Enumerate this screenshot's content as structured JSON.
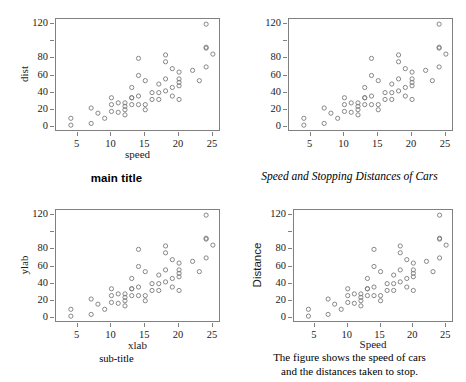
{
  "figure": {
    "point_color": "#7a7a7a",
    "axis_color": "#808080",
    "text_color": "#1a1a1a",
    "background": "#ffffff"
  },
  "chart_data": [
    {
      "id": "top-left",
      "type": "scatter",
      "title": "main title",
      "title_style": "sans-bold",
      "subtitle": "",
      "caption": "",
      "xlabel": "speed",
      "ylabel": "dist",
      "xlim": [
        1.8,
        26.2
      ],
      "ylim": [
        -6,
        126
      ],
      "xticks": [
        5,
        10,
        15,
        20,
        25
      ],
      "yticks": [
        0,
        20,
        40,
        60,
        80,
        100,
        120
      ],
      "ytick_labels": [
        "0",
        "20",
        "40",
        "60",
        "80",
        "",
        "120"
      ],
      "xtick_labels": [
        "5",
        "10",
        "15",
        "20",
        "25"
      ],
      "grid": false,
      "legend": "none",
      "x": [
        4,
        4,
        7,
        7,
        8,
        9,
        10,
        10,
        10,
        11,
        11,
        12,
        12,
        12,
        12,
        13,
        13,
        13,
        13,
        14,
        14,
        14,
        14,
        15,
        15,
        15,
        16,
        16,
        17,
        17,
        17,
        18,
        18,
        18,
        18,
        19,
        19,
        19,
        20,
        20,
        20,
        20,
        20,
        22,
        23,
        24,
        24,
        24,
        24,
        25
      ],
      "y": [
        2,
        10,
        4,
        22,
        16,
        10,
        18,
        26,
        34,
        17,
        28,
        14,
        20,
        24,
        28,
        26,
        34,
        34,
        46,
        26,
        36,
        60,
        80,
        20,
        26,
        54,
        32,
        40,
        32,
        40,
        50,
        42,
        56,
        76,
        84,
        36,
        46,
        68,
        32,
        48,
        52,
        56,
        64,
        66,
        54,
        70,
        92,
        93,
        120,
        85
      ]
    },
    {
      "id": "top-right",
      "type": "scatter",
      "title": "Speed and Stopping Distances of Cars",
      "title_style": "serif-italic",
      "subtitle": "",
      "caption": "",
      "xlabel": "",
      "ylabel": "",
      "xlim": [
        1.8,
        26.2
      ],
      "ylim": [
        -6,
        126
      ],
      "xticks": [
        5,
        10,
        15,
        20,
        25
      ],
      "yticks": [
        0,
        20,
        40,
        60,
        80,
        100,
        120
      ],
      "ytick_labels": [
        "0",
        "20",
        "40",
        "60",
        "80",
        "",
        "120"
      ],
      "xtick_labels": [
        "5",
        "10",
        "15",
        "20",
        "25"
      ],
      "grid": false,
      "legend": "none",
      "x": [
        4,
        4,
        7,
        7,
        8,
        9,
        10,
        10,
        10,
        11,
        11,
        12,
        12,
        12,
        12,
        13,
        13,
        13,
        13,
        14,
        14,
        14,
        14,
        15,
        15,
        15,
        16,
        16,
        17,
        17,
        17,
        18,
        18,
        18,
        18,
        19,
        19,
        19,
        20,
        20,
        20,
        20,
        20,
        22,
        23,
        24,
        24,
        24,
        24,
        25
      ],
      "y": [
        2,
        10,
        4,
        22,
        16,
        10,
        18,
        26,
        34,
        17,
        28,
        14,
        20,
        24,
        28,
        26,
        34,
        34,
        46,
        26,
        36,
        60,
        80,
        20,
        26,
        54,
        32,
        40,
        32,
        40,
        50,
        42,
        56,
        76,
        84,
        36,
        46,
        68,
        32,
        48,
        52,
        56,
        64,
        66,
        54,
        70,
        92,
        93,
        120,
        85
      ]
    },
    {
      "id": "bottom-left",
      "type": "scatter",
      "title": "",
      "title_style": "",
      "subtitle": "sub-title",
      "caption": "",
      "xlabel": "xlab",
      "ylabel": "ylab",
      "xlim": [
        1.8,
        26.2
      ],
      "ylim": [
        -6,
        126
      ],
      "xticks": [
        5,
        10,
        15,
        20,
        25
      ],
      "yticks": [
        0,
        20,
        40,
        60,
        80,
        100,
        120
      ],
      "ytick_labels": [
        "0",
        "20",
        "40",
        "60",
        "80",
        "",
        "120"
      ],
      "xtick_labels": [
        "5",
        "10",
        "15",
        "20",
        "25"
      ],
      "grid": false,
      "legend": "none",
      "x": [
        4,
        4,
        7,
        7,
        8,
        9,
        10,
        10,
        10,
        11,
        11,
        12,
        12,
        12,
        12,
        13,
        13,
        13,
        13,
        14,
        14,
        14,
        14,
        15,
        15,
        15,
        16,
        16,
        17,
        17,
        17,
        18,
        18,
        18,
        18,
        19,
        19,
        19,
        20,
        20,
        20,
        20,
        20,
        22,
        23,
        24,
        24,
        24,
        24,
        25
      ],
      "y": [
        2,
        10,
        4,
        22,
        16,
        10,
        18,
        26,
        34,
        17,
        28,
        14,
        20,
        24,
        28,
        26,
        34,
        34,
        46,
        26,
        36,
        60,
        80,
        20,
        26,
        54,
        32,
        40,
        32,
        40,
        50,
        42,
        56,
        76,
        84,
        36,
        46,
        68,
        32,
        48,
        52,
        56,
        64,
        66,
        54,
        70,
        92,
        93,
        120,
        85
      ]
    },
    {
      "id": "bottom-right",
      "type": "scatter",
      "title": "",
      "title_style": "",
      "subtitle": "",
      "caption_line1": "The figure shows the speed of cars",
      "caption_line2": "and the distances taken to stop.",
      "xlabel": "Speed",
      "ylabel": "Distance",
      "ylabel_style": "sans",
      "xlim": [
        1.8,
        26.2
      ],
      "ylim": [
        -6,
        126
      ],
      "xticks": [
        5,
        10,
        15,
        20,
        25
      ],
      "yticks": [
        0,
        20,
        40,
        60,
        80,
        100,
        120
      ],
      "ytick_labels": [
        "0",
        "20",
        "40",
        "60",
        "80",
        "",
        "120"
      ],
      "xtick_labels": [
        "5",
        "10",
        "15",
        "20",
        "25"
      ],
      "grid": false,
      "legend": "none",
      "x": [
        4,
        4,
        7,
        7,
        8,
        9,
        10,
        10,
        10,
        11,
        11,
        12,
        12,
        12,
        12,
        13,
        13,
        13,
        13,
        14,
        14,
        14,
        14,
        15,
        15,
        15,
        16,
        16,
        17,
        17,
        17,
        18,
        18,
        18,
        18,
        19,
        19,
        19,
        20,
        20,
        20,
        20,
        20,
        22,
        23,
        24,
        24,
        24,
        24,
        25
      ],
      "y": [
        2,
        10,
        4,
        22,
        16,
        10,
        18,
        26,
        34,
        17,
        28,
        14,
        20,
        24,
        28,
        26,
        34,
        34,
        46,
        26,
        36,
        60,
        80,
        20,
        26,
        54,
        32,
        40,
        32,
        40,
        50,
        42,
        56,
        76,
        84,
        36,
        46,
        68,
        32,
        48,
        52,
        56,
        64,
        66,
        54,
        70,
        92,
        93,
        120,
        85
      ]
    }
  ]
}
